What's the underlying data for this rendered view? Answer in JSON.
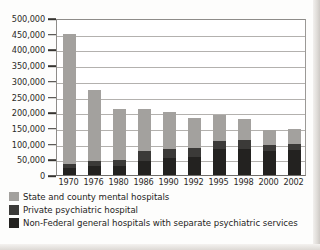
{
  "chart_data": {
    "type": "bar",
    "stacked": true,
    "title": "",
    "xlabel": "",
    "ylabel": "",
    "categories": [
      "1970",
      "1976",
      "1980",
      "1986",
      "1990",
      "1992",
      "1995",
      "1998",
      "2000",
      "2002"
    ],
    "ylim": [
      0,
      500000
    ],
    "yticks": [
      0,
      50000,
      100000,
      150000,
      200000,
      250000,
      300000,
      350000,
      400000,
      450000,
      500000
    ],
    "ytick_labels": [
      "0",
      "50,000",
      "100,000",
      "150,000",
      "200,000",
      "250,000",
      "300,000",
      "350,000",
      "400,000",
      "450,000",
      "500,000"
    ],
    "grid": true,
    "legend_position": "below",
    "series": [
      {
        "name": "Non-Federal general hospitals with separate psychiatric services",
        "color": "#232220",
        "values": [
          22000,
          28000,
          29000,
          45000,
          53000,
          56000,
          82000,
          84000,
          75000,
          80000
        ]
      },
      {
        "name": "Private psychiatric hospital",
        "color": "#3b3a38",
        "values": [
          14000,
          17000,
          18000,
          30000,
          30000,
          30000,
          27000,
          26000,
          20000,
          20000
        ]
      },
      {
        "name": "State and county mental hospitals",
        "color": "#a3a19e",
        "values": [
          414000,
          227000,
          163000,
          135000,
          117000,
          94000,
          81000,
          70000,
          49000,
          47000
        ]
      }
    ],
    "totals": [
      450000,
      272000,
      210000,
      210000,
      200000,
      180000,
      190000,
      180000,
      144000,
      147000
    ]
  },
  "legend": {
    "items": [
      {
        "label": "State and county mental hospitals",
        "color": "#a3a19e"
      },
      {
        "label": "Private psychiatric hospital",
        "color": "#3b3a38"
      },
      {
        "label": "Non-Federal general hospitals with separate psychiatric services",
        "color": "#232220"
      }
    ]
  }
}
